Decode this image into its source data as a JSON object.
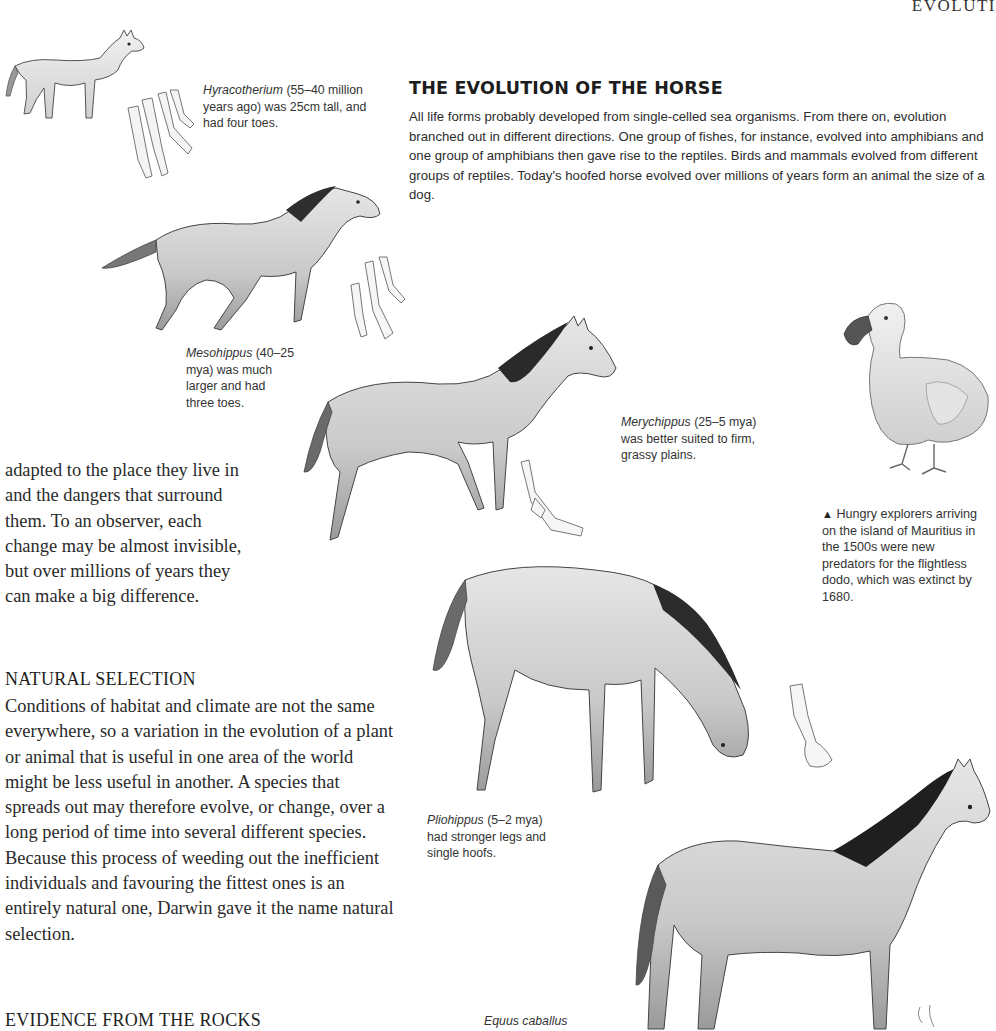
{
  "page": {
    "running_head": "EVOLUTI"
  },
  "feature": {
    "title": "THE EVOLUTION OF THE HORSE",
    "intro": "All life forms probably developed from single-celled sea organisms. From there on, evolution branched out in different directions. One group of fishes, for instance, evolved into amphibians and one group of amphibians then gave rise to the reptiles. Birds and mammals evolved from different groups of reptiles. Today's hoofed horse evolved over millions of years form an animal the size of a dog."
  },
  "captions": {
    "hyracotherium": {
      "name": "Hyracotherium",
      "text": " (55–40 million years ago) was 25cm tall, and had four toes."
    },
    "mesohippus": {
      "name": "Mesohippus",
      "text": " (40–25 mya) was much larger and had three toes."
    },
    "merychippus": {
      "name": "Merychippus",
      "text": " (25–5 mya) was better suited to firm, grassy plains."
    },
    "pliohippus": {
      "name": "Pliohippus",
      "text": " (5–2 mya) had stronger legs and single hoofs."
    },
    "equus": {
      "name": "Equus caballus",
      "text": ""
    },
    "dodo": {
      "marker": "▲",
      "text": " Hungry explorers arriving on the island of Mauritius in the 1500s were new predators for the flightless dodo, which was extinct by 1680."
    }
  },
  "body": {
    "para1": "adapted to the place they live in and the dangers that surround them. To an observer, each change may be almost invisible, but over millions of years they can make a big difference.",
    "section1_head": "NATURAL SELECTION",
    "para2": "Conditions of habitat and climate are not the same everywhere, so a variation in the evolution of a plant or animal that is useful in one area of the world might be less useful in another. A species that spreads out may therefore evolve, or change, over a long period of time into several different species. Because this process of weeding out the inefficient individuals and favouring the fittest ones is an entirely natural one, Darwin gave it the name natural selection.",
    "section2_head": "EVIDENCE FROM THE ROCKS"
  },
  "illustrations": [
    {
      "id": "hyracotherium",
      "label": "Hyracotherium illustration"
    },
    {
      "id": "hyracotherium-foot",
      "label": "four-toed foot"
    },
    {
      "id": "mesohippus",
      "label": "Mesohippus illustration"
    },
    {
      "id": "mesohippus-foot",
      "label": "three-toed foot"
    },
    {
      "id": "merychippus",
      "label": "Merychippus illustration"
    },
    {
      "id": "merychippus-foot",
      "label": "foot"
    },
    {
      "id": "pliohippus",
      "label": "Pliohippus illustration"
    },
    {
      "id": "pliohippus-foot",
      "label": "single hoof"
    },
    {
      "id": "equus",
      "label": "Equus caballus illustration"
    },
    {
      "id": "dodo",
      "label": "Dodo illustration"
    }
  ],
  "colors": {
    "ink": "#222222",
    "sketch_light": "#d9d9d9",
    "sketch_mid": "#a8a8a8",
    "sketch_dark": "#3c3c3c"
  }
}
